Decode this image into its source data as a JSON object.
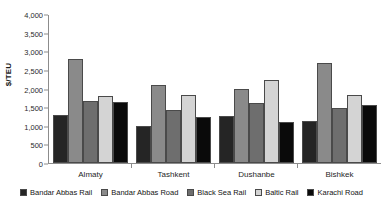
{
  "chart_data": {
    "type": "bar",
    "title": "",
    "subtitle": "",
    "xlabel": "",
    "ylabel": "$/TEU",
    "ylim": [
      0,
      4000
    ],
    "ytick_step": 500,
    "ytick_labels": [
      "4,000",
      "3,500",
      "3,000",
      "2,500",
      "2,000",
      "1,500",
      "1,000",
      "500",
      "0"
    ],
    "ytick_values": [
      4000,
      3500,
      3000,
      2500,
      2000,
      1500,
      1000,
      500,
      0
    ],
    "grid": false,
    "legend_position": "bottom",
    "categories": [
      "Almaty",
      "Tashkent",
      "Dushanbe",
      "Bishkek"
    ],
    "series": [
      {
        "name": "Bandar Abbas Rail",
        "color": "#252525",
        "values": [
          1300,
          1000,
          1260,
          1120
        ]
      },
      {
        "name": "Bandar Abbas Road",
        "color": "#8a8a8a",
        "values": [
          2800,
          2090,
          1980,
          2680
        ]
      },
      {
        "name": "Black Sea Rail",
        "color": "#6e6e6e",
        "values": [
          1660,
          1420,
          1620,
          1470
        ]
      },
      {
        "name": "Baltic Rail",
        "color": "#d4d4d4",
        "values": [
          1810,
          1820,
          2220,
          1820
        ]
      },
      {
        "name": "Karachi Road",
        "color": "#0a0a0a",
        "values": [
          1640,
          1230,
          1100,
          1570
        ]
      }
    ]
  },
  "axis": {
    "y_title": "$/TEU"
  },
  "legend": {
    "items": [
      {
        "label": "Bandar Abbas Rail",
        "color": "#252525"
      },
      {
        "label": "Bandar Abbas Road",
        "color": "#8a8a8a"
      },
      {
        "label": "Black Sea Rail",
        "color": "#6e6e6e"
      },
      {
        "label": "Baltic Rail",
        "color": "#d4d4d4"
      },
      {
        "label": "Karachi Road",
        "color": "#0a0a0a"
      }
    ]
  },
  "colors": {
    "axis_line": "#8c8c8c",
    "bar_outline": "#4a4a4a",
    "text": "#1a1a1a",
    "background": "#ffffff"
  }
}
